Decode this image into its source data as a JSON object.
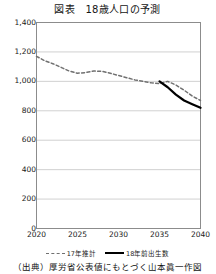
{
  "figure": {
    "title": "図表　18歳人口の予測",
    "source": "（出典）厚労省公表値にもとづく山本眞一作図"
  },
  "legend": {
    "items": [
      {
        "label": "17年推計",
        "style": "dashed",
        "color": "#707070"
      },
      {
        "label": "18年前出生数",
        "style": "solid",
        "color": "#000000"
      }
    ]
  },
  "axis": {
    "y_ticks": [
      "1,400",
      "1,200",
      "1,000",
      "800",
      "600",
      "400",
      "200",
      "0"
    ],
    "x_ticks": [
      "2020",
      "2025",
      "2030",
      "2035",
      "2040"
    ]
  },
  "chart_data": {
    "type": "line",
    "title": "図表　18歳人口の予測",
    "xlabel": "",
    "ylabel": "",
    "xlim": [
      2020,
      2040
    ],
    "ylim": [
      0,
      1400
    ],
    "grid": true,
    "legend_position": "bottom",
    "yticks": [
      0,
      200,
      400,
      600,
      800,
      1000,
      1200,
      1400
    ],
    "xticks": [
      2020,
      2025,
      2030,
      2035,
      2040
    ],
    "series": [
      {
        "name": "17年推計",
        "style": "dashed",
        "color": "#707070",
        "x": [
          2020,
          2021,
          2022,
          2023,
          2024,
          2025,
          2026,
          2027,
          2028,
          2029,
          2030,
          2031,
          2032,
          2033,
          2034,
          2035,
          2036,
          2037,
          2038,
          2039,
          2040
        ],
        "values": [
          1170,
          1140,
          1120,
          1095,
          1070,
          1055,
          1060,
          1070,
          1068,
          1055,
          1040,
          1025,
          1010,
          1000,
          990,
          985,
          1000,
          975,
          940,
          900,
          870
        ]
      },
      {
        "name": "18年前出生数",
        "style": "solid",
        "color": "#000000",
        "x": [
          2035,
          2036,
          2037,
          2038,
          2039,
          2040
        ],
        "values": [
          1000,
          960,
          910,
          870,
          845,
          820
        ]
      }
    ]
  }
}
